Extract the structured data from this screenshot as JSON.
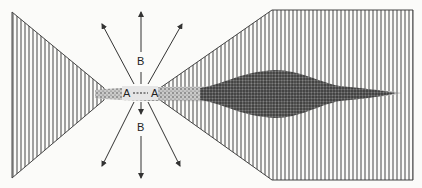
{
  "diagram": {
    "labels": {
      "a_left": "A",
      "a_right": "A",
      "b_top": "B",
      "b_bottom": "B"
    },
    "regions": [
      {
        "name": "left-hatched-cone",
        "pattern": "vertical-hatching"
      },
      {
        "name": "right-hatched-fan",
        "pattern": "vertical-hatching"
      },
      {
        "name": "central-stippled-beam",
        "pattern": "stipple"
      },
      {
        "name": "dense-stippled-bulge",
        "pattern": "dense-stipple"
      }
    ],
    "arrows": [
      {
        "name": "arrow-up",
        "direction": "up"
      },
      {
        "name": "arrow-down",
        "direction": "down"
      },
      {
        "name": "arrow-upper-left",
        "direction": "upper-left"
      },
      {
        "name": "arrow-upper-right",
        "direction": "upper-right"
      },
      {
        "name": "arrow-lower-left",
        "direction": "lower-left"
      },
      {
        "name": "arrow-lower-right",
        "direction": "lower-right"
      }
    ],
    "colors": {
      "ink": "#333333",
      "hatch": "#555555",
      "stipple": "#444444",
      "background": "#fbfbf9"
    }
  }
}
